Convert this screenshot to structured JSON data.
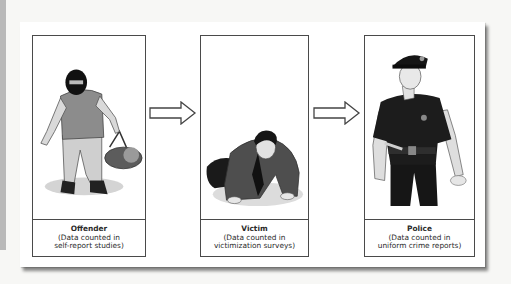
{
  "diagram": {
    "panels": [
      {
        "id": "offender",
        "title": "Offender",
        "line1": "(Data counted in",
        "line2": "self-report studies)",
        "figure": "masked-offender-with-bag"
      },
      {
        "id": "victim",
        "title": "Victim",
        "line1": "(Data counted in",
        "line2": "victimization surveys)",
        "figure": "crouching-victim"
      },
      {
        "id": "police",
        "title": "Police",
        "line1": "(Data counted in",
        "line2": "uniform crime reports)",
        "figure": "police-officer"
      }
    ],
    "arrows": [
      {
        "from": "offender",
        "to": "victim",
        "icon": "right-arrow-icon"
      },
      {
        "from": "victim",
        "to": "police",
        "icon": "right-arrow-icon"
      }
    ]
  }
}
